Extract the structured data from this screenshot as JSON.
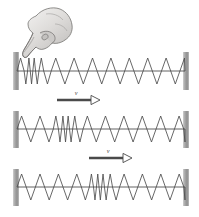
{
  "figure": {
    "background_color": "#ffffff",
    "spring_color": "#4d4d4d",
    "axis_color": "#3a3a3a",
    "wall_color": "#9a9a9a",
    "hand": {
      "icon": "hand-pointing-finger-icon",
      "description": "grayscale drawing of a hand with index finger extended downward touching the left end of the spring",
      "skin_color": "#d8d6d4",
      "outline_color": "#6e6c6a"
    },
    "panels": [
      {
        "id": "panel-1",
        "label": "spring with compression created at hand end",
        "axis_y": 71,
        "left_wall_x": 13,
        "right_wall_x": 183,
        "wall_top": 52,
        "wall_height": 38,
        "amplitude": 13,
        "compression_center": 30,
        "compression_width": 16,
        "has_hand": true,
        "has_velocity_arrow": false,
        "velocity_label": ""
      },
      {
        "id": "panel-2",
        "label": "compression pulse moved to left-of-center",
        "axis_y": 129,
        "left_wall_x": 13,
        "right_wall_x": 183,
        "wall_top": 111,
        "wall_height": 37,
        "amplitude": 13,
        "compression_center": 64,
        "compression_width": 18,
        "has_hand": false,
        "has_velocity_arrow": true,
        "velocity_label": "v",
        "arrow": {
          "x1": 57,
          "x2": 100,
          "y": 100,
          "label_x": 76,
          "label_y": 95
        }
      },
      {
        "id": "panel-3",
        "label": "compression pulse moved to center",
        "axis_y": 187,
        "left_wall_x": 13,
        "right_wall_x": 183,
        "wall_top": 169,
        "wall_height": 37,
        "amplitude": 13,
        "compression_center": 98,
        "compression_width": 18,
        "has_hand": false,
        "has_velocity_arrow": true,
        "velocity_label": "v",
        "arrow": {
          "x1": 89,
          "x2": 132,
          "y": 158,
          "label_x": 108,
          "label_y": 153
        }
      }
    ],
    "arrow_style": {
      "shaft_color": "#4a4a4a",
      "head_fill": "#ffffff",
      "head_stroke": "#4a4a4a",
      "shaft_width": 2.4
    }
  }
}
